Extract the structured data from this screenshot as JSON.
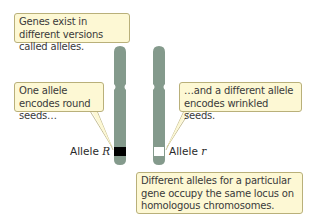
{
  "callouts": {
    "genes_exist": "Genes exist in different versions called alleles.",
    "one_allele": "One allele encodes round seeds…",
    "different_allele": "…and a different allele encodes wrinkled seeds.",
    "locus": "Different alleles for a particular gene occupy the same locus on homologous chromosomes."
  },
  "labels": {
    "allele_R_prefix": "Allele ",
    "allele_R_symbol": "R",
    "allele_r_prefix": "Allele ",
    "allele_r_symbol": "r"
  },
  "colors": {
    "chromosome": "#849a8c",
    "callout_bg": "#fdf8d4",
    "callout_border": "#b9b07a",
    "allele_R": "#000000",
    "allele_r": "#ffffff"
  }
}
